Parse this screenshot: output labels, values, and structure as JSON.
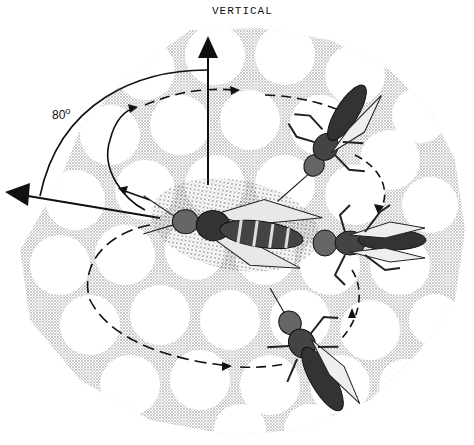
{
  "figure": {
    "labels": {
      "vertical": "VERTICAL",
      "angle_value": "80",
      "angle_unit": "o"
    },
    "colors": {
      "ink": "#111111",
      "comb_stipple": "#9a9a9a",
      "background": "#ffffff"
    },
    "elements": {
      "vertical_arrow": "Arrow pointing up indicating vertical direction",
      "direction_arrow": "Arrow pointing left indicating waggle run direction, 80 degrees from vertical",
      "angle_arc": "Arc from vertical to waggle direction",
      "return_path_right": "Dashed return loop on right side",
      "return_path_left": "Dashed return loop on left/bottom",
      "dancer_bee": "Central dancing bee performing waggle run",
      "follower_bees": [
        "Follower bee upper right",
        "Follower bee right",
        "Follower bee lower right"
      ]
    }
  }
}
